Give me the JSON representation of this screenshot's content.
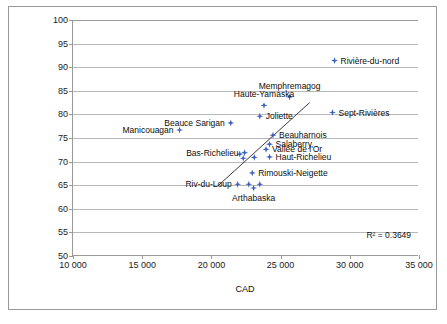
{
  "chart_data": {
    "type": "scatter",
    "title": "",
    "xlabel": "CAD",
    "ylabel": "% d'entreprises manufacturières et d'entreprises de services par rapport au total",
    "xlim": [
      10000,
      35000
    ],
    "ylim": [
      50,
      100
    ],
    "xticks": [
      10000,
      15000,
      20000,
      25000,
      30000,
      35000
    ],
    "xtick_labels": [
      "10 000",
      "15 000",
      "20 000",
      "25 000",
      "30 000",
      "35 000"
    ],
    "yticks": [
      50,
      55,
      60,
      65,
      70,
      75,
      80,
      85,
      90,
      95,
      100
    ],
    "ytick_labels": [
      "50",
      "55",
      "60",
      "65",
      "70",
      "75",
      "80",
      "85",
      "90",
      "95",
      "100"
    ],
    "grid": "horizontal",
    "legend": "none",
    "marker_color": "#3a5fbe",
    "gridline_color": "#b8b8b8",
    "axis_color": "#9a9a9a",
    "annotations": [
      {
        "text": "R² = 0.3649",
        "x": 31200,
        "y": 55.4
      }
    ],
    "trendline": {
      "type": "linear",
      "x_start": 20450,
      "y_start": 64.8,
      "x_end": 27100,
      "y_end": 82.5,
      "r_squared": 0.3649,
      "color": "#3b3b3b"
    },
    "points": [
      {
        "name": "Rivière-du-nord",
        "x": 28900,
        "y": 91.4,
        "label_pos": "right"
      },
      {
        "name": "Memphremagog",
        "x": 25650,
        "y": 83.7,
        "label_pos": "above"
      },
      {
        "name": "Haute-Yamaska",
        "x": 23800,
        "y": 81.9,
        "label_pos": "above"
      },
      {
        "name": "Beauce Sarigan",
        "x": 21400,
        "y": 78.2,
        "label_pos": "left"
      },
      {
        "name": "Sept-Rivières",
        "x": 28750,
        "y": 80.4,
        "label_pos": "right"
      },
      {
        "name": "Joliette",
        "x": 23500,
        "y": 79.6,
        "label_pos": "right"
      },
      {
        "name": "Manicouagan",
        "x": 17700,
        "y": 76.7,
        "label_pos": "left"
      },
      {
        "name": "Beauharnois",
        "x": 24450,
        "y": 75.6,
        "label_pos": "right"
      },
      {
        "name": "Salaberry",
        "x": 24200,
        "y": 73.7,
        "label_pos": "right"
      },
      {
        "name": "Vallée de l'Or",
        "x": 23950,
        "y": 72.6,
        "label_pos": "right"
      },
      {
        "name": "Bas-Richelieu",
        "x": 22400,
        "y": 71.9,
        "label_pos": "left"
      },
      {
        "name": "Haut-Richelieu",
        "x": 24200,
        "y": 71.0,
        "label_pos": "right"
      },
      {
        "name": "Rimouski-Neigette",
        "x": 22950,
        "y": 67.6,
        "label_pos": "right"
      },
      {
        "name": "Riv-du-Loup",
        "x": 21900,
        "y": 65.2,
        "label_pos": "left"
      },
      {
        "name": "Arthabaska",
        "x": 23050,
        "y": 64.4,
        "label_pos": "below"
      },
      {
        "name": "",
        "x": 22050,
        "y": 71.6,
        "label_pos": "none"
      },
      {
        "name": "",
        "x": 22300,
        "y": 70.7,
        "label_pos": "none"
      },
      {
        "name": "",
        "x": 23100,
        "y": 70.9,
        "label_pos": "none"
      },
      {
        "name": "",
        "x": 22700,
        "y": 65.2,
        "label_pos": "none"
      },
      {
        "name": "",
        "x": 23500,
        "y": 65.2,
        "label_pos": "none"
      }
    ]
  }
}
